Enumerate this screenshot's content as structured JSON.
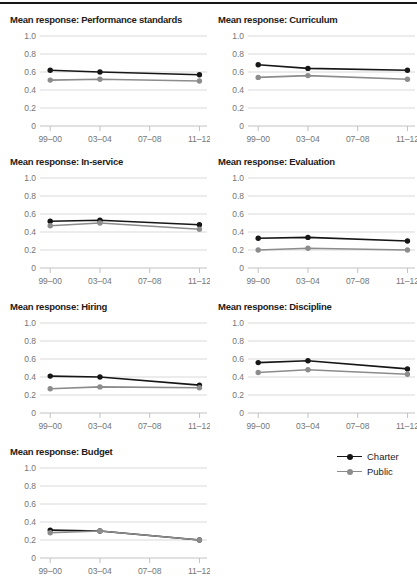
{
  "style": {
    "charter_color": "#161616",
    "public_color": "#8c8c8c",
    "grid_color": "#d9d9d9",
    "axis_color": "#c2c2c2",
    "tick_label_color": "#757575",
    "title_color": "#1c1c1c",
    "top_rule_color": "#161616"
  },
  "axes": {
    "ylim": [
      0,
      1.0
    ],
    "yticks": [
      0,
      0.2,
      0.4,
      0.6,
      0.8,
      1.0
    ],
    "ytick_labels": [
      "0",
      "0.2",
      "0.4",
      "0.6",
      "0.8",
      "1.0"
    ],
    "xticks": [
      0.05,
      0.3533,
      0.6567,
      0.96
    ],
    "xtick_labels": [
      "99–00",
      "03–04",
      "07–08",
      "11–12"
    ],
    "data_x_indices": [
      0,
      1,
      3
    ],
    "grid": true
  },
  "legend": {
    "position": "bottom-right",
    "items": [
      {
        "label": "Charter",
        "color": "#161616"
      },
      {
        "label": "Public",
        "color": "#8c8c8c"
      }
    ]
  },
  "chart_data": [
    {
      "type": "line",
      "title": "Mean response: Performance standards",
      "x_categories": [
        "99–00",
        "03–04",
        "11–12"
      ],
      "ylim": [
        0,
        1.0
      ],
      "series": [
        {
          "name": "Charter",
          "values": [
            0.62,
            0.6,
            0.57
          ]
        },
        {
          "name": "Public",
          "values": [
            0.51,
            0.52,
            0.5
          ]
        }
      ]
    },
    {
      "type": "line",
      "title": "Mean response: Curriculum",
      "x_categories": [
        "99–00",
        "03–04",
        "11–12"
      ],
      "ylim": [
        0,
        1.0
      ],
      "series": [
        {
          "name": "Charter",
          "values": [
            0.68,
            0.64,
            0.62
          ]
        },
        {
          "name": "Public",
          "values": [
            0.54,
            0.56,
            0.52
          ]
        }
      ]
    },
    {
      "type": "line",
      "title": "Mean response: In-service",
      "x_categories": [
        "99–00",
        "03–04",
        "11–12"
      ],
      "ylim": [
        0,
        1.0
      ],
      "series": [
        {
          "name": "Charter",
          "values": [
            0.52,
            0.53,
            0.48
          ]
        },
        {
          "name": "Public",
          "values": [
            0.47,
            0.5,
            0.43
          ]
        }
      ]
    },
    {
      "type": "line",
      "title": "Mean response: Evaluation",
      "x_categories": [
        "99–00",
        "03–04",
        "11–12"
      ],
      "ylim": [
        0,
        1.0
      ],
      "series": [
        {
          "name": "Charter",
          "values": [
            0.33,
            0.34,
            0.3
          ]
        },
        {
          "name": "Public",
          "values": [
            0.2,
            0.22,
            0.2
          ]
        }
      ]
    },
    {
      "type": "line",
      "title": "Mean response: Hiring",
      "x_categories": [
        "99–00",
        "03–04",
        "11–12"
      ],
      "ylim": [
        0,
        1.0
      ],
      "series": [
        {
          "name": "Charter",
          "values": [
            0.41,
            0.4,
            0.31
          ]
        },
        {
          "name": "Public",
          "values": [
            0.27,
            0.29,
            0.28
          ]
        }
      ]
    },
    {
      "type": "line",
      "title": "Mean response: Discipline",
      "x_categories": [
        "99–00",
        "03–04",
        "11–12"
      ],
      "ylim": [
        0,
        1.0
      ],
      "series": [
        {
          "name": "Charter",
          "values": [
            0.56,
            0.58,
            0.49
          ]
        },
        {
          "name": "Public",
          "values": [
            0.45,
            0.48,
            0.43
          ]
        }
      ]
    },
    {
      "type": "line",
      "title": "Mean response: Budget",
      "x_categories": [
        "99–00",
        "03–04",
        "11–12"
      ],
      "ylim": [
        0,
        1.0
      ],
      "series": [
        {
          "name": "Charter",
          "values": [
            0.31,
            0.3,
            0.2
          ]
        },
        {
          "name": "Public",
          "values": [
            0.28,
            0.3,
            0.2
          ]
        }
      ]
    }
  ]
}
